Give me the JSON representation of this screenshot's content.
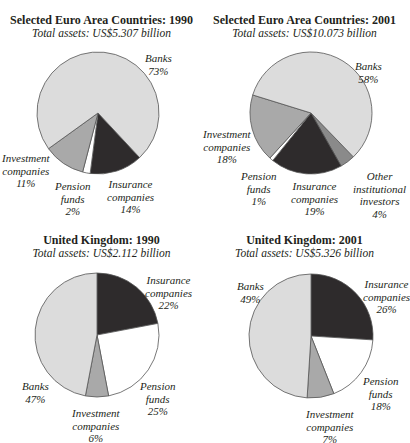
{
  "chart_data": [
    {
      "type": "pie",
      "title": "Selected Euro Area Countries: 1990",
      "subtitle": "Total assets: US$5.307 billion",
      "categories": [
        "Banks",
        "Insurance companies",
        "Pension funds",
        "Investment companies"
      ],
      "values": [
        73,
        14,
        2,
        11
      ],
      "unit": "%",
      "labels": {
        "banks": [
          "Banks",
          "73%"
        ],
        "insurance": [
          "Insurance",
          "companies",
          "14%"
        ],
        "pension": [
          "Pension",
          "funds",
          "2%"
        ],
        "investment": [
          "Investment",
          "companies",
          "11%"
        ]
      }
    },
    {
      "type": "pie",
      "title": "Selected Euro Area Countries: 2001",
      "subtitle": "Total assets: US$10.073 billion",
      "categories": [
        "Banks",
        "Other institutional investors",
        "Insurance companies",
        "Pension funds",
        "Investment companies"
      ],
      "values": [
        58,
        4,
        19,
        1,
        18
      ],
      "unit": "%",
      "labels": {
        "banks": [
          "Banks",
          "58%"
        ],
        "other": [
          "Other",
          "institutional",
          "investors",
          "4%"
        ],
        "insurance": [
          "Insurance",
          "companies",
          "19%"
        ],
        "pension": [
          "Pension",
          "funds",
          "1%"
        ],
        "investment": [
          "Investment",
          "companies",
          "18%"
        ]
      }
    },
    {
      "type": "pie",
      "title": "United Kingdom: 1990",
      "subtitle": "Total assets: US$2.112 billion",
      "categories": [
        "Insurance companies",
        "Pension funds",
        "Investment companies",
        "Banks"
      ],
      "values": [
        22,
        25,
        6,
        47
      ],
      "unit": "%",
      "labels": {
        "insurance": [
          "Insurance",
          "companies",
          "22%"
        ],
        "pension": [
          "Pension",
          "funds",
          "25%"
        ],
        "investment": [
          "Investment",
          "companies",
          "6%"
        ],
        "banks": [
          "Banks",
          "47%"
        ]
      }
    },
    {
      "type": "pie",
      "title": "United Kingdom: 2001",
      "subtitle": "Total assets: US$5.326 billion",
      "categories": [
        "Insurance companies",
        "Pension funds",
        "Investment companies",
        "Banks"
      ],
      "values": [
        26,
        18,
        7,
        49
      ],
      "unit": "%",
      "labels": {
        "insurance": [
          "Insurance",
          "companies",
          "26%"
        ],
        "pension": [
          "Pension",
          "funds",
          "18%"
        ],
        "investment": [
          "Investment",
          "companies",
          "7%"
        ],
        "banks": [
          "Banks",
          "49%"
        ]
      }
    }
  ],
  "colors": {
    "banks": "#dcdcdc",
    "insurance": "#2e2b2c",
    "pension": "#ffffff",
    "investment": "#a9a9a9",
    "other": "#8a8a8a",
    "outline": "#555555"
  }
}
